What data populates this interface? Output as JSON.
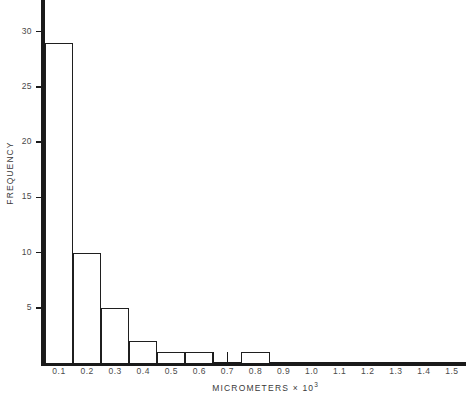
{
  "chart_data": {
    "type": "bar",
    "title": "",
    "subtitle": "",
    "xlabel": "MICROMETERS × 10³",
    "xlabel_text": "MICROMETERS × 10",
    "xlabel_sup": "3",
    "ylabel": "FREQUENCY",
    "categories": [
      "0.1",
      "0.2",
      "0.3",
      "0.4",
      "0.5",
      "0.6",
      "0.7",
      "0.8",
      "0.9",
      "1.0",
      "1.1",
      "1.2",
      "1.3",
      "1.4",
      "1.5"
    ],
    "values": [
      29,
      10,
      5,
      2,
      1,
      1,
      0,
      1,
      0,
      0,
      0,
      0,
      0,
      0,
      0
    ],
    "x": [
      0.1,
      0.2,
      0.3,
      0.4,
      0.5,
      0.6,
      0.7,
      0.8,
      0.9,
      1.0,
      1.1,
      1.2,
      1.3,
      1.4,
      1.5
    ],
    "bin_width": 0.1,
    "xlim": [
      0.05,
      1.55
    ],
    "ylim": [
      0,
      31
    ],
    "yticks": [
      5,
      10,
      15,
      20,
      25,
      30
    ],
    "ytick_labels": [
      "5",
      "10",
      "15",
      "20",
      "25",
      "30"
    ],
    "xtick_labels": [
      "0.1",
      "0.2",
      "0.3",
      "0.4",
      "0.5",
      "0.6",
      "0.7",
      "0.8",
      "0.9",
      "1.0",
      "1.1",
      "1.2",
      "1.3",
      "1.4",
      "1.5"
    ],
    "grid": false,
    "legend": false,
    "legend_position": "none",
    "bar_style": "open-outline",
    "colors": {
      "axis": "#1a1a1a",
      "bar_edge": "#1f1f1f",
      "bar_fill": "#ffffff",
      "text": "#4a4a4a",
      "background": "#ffffff"
    }
  }
}
